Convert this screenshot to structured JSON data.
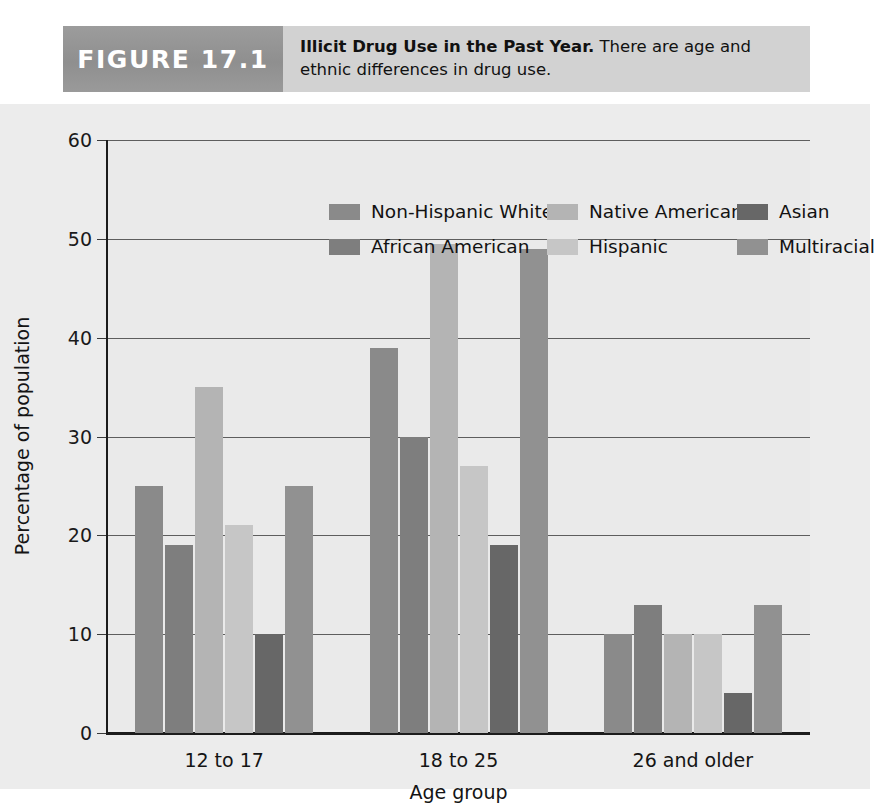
{
  "figure": {
    "number_label": "FIGURE 17.1",
    "caption_title": "Illicit Drug Use in the Past Year.",
    "caption_body": "There are age and ethnic differences in drug use."
  },
  "chart_data": {
    "type": "bar",
    "title": "Illicit Drug Use in the Past Year",
    "xlabel": "Age group",
    "ylabel": "Percentage of population",
    "categories": [
      "12 to 17",
      "18  to 25",
      "26 and older"
    ],
    "ylim": [
      0,
      60
    ],
    "yticks": [
      "0",
      "10",
      "20",
      "30",
      "40",
      "50",
      "60"
    ],
    "grid": true,
    "legend_position": "top-inside",
    "series": [
      {
        "name": "Non-Hispanic White",
        "color": "#8a8a8a",
        "values": [
          25,
          39,
          10
        ]
      },
      {
        "name": "African American",
        "color": "#7e7e7e",
        "values": [
          19,
          30,
          13
        ]
      },
      {
        "name": "Native American",
        "color": "#b4b4b4",
        "values": [
          35,
          49.5,
          10
        ]
      },
      {
        "name": "Hispanic",
        "color": "#c6c6c6",
        "values": [
          21,
          27,
          10
        ]
      },
      {
        "name": "Asian",
        "color": "#676767",
        "values": [
          10,
          19,
          4
        ]
      },
      {
        "name": "Multiracial",
        "color": "#919191",
        "values": [
          25,
          49,
          13
        ]
      }
    ]
  }
}
